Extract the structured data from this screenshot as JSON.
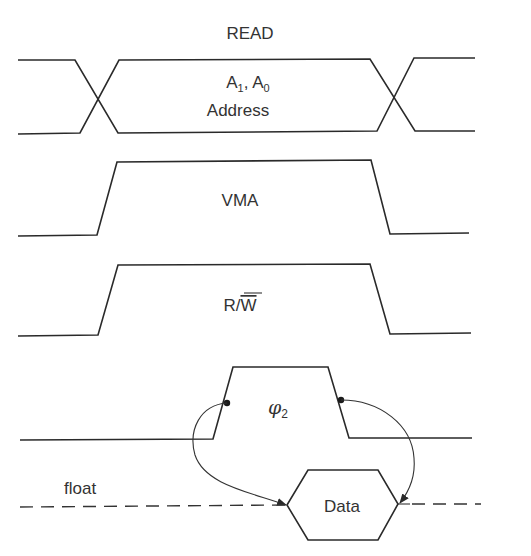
{
  "diagram": {
    "type": "timing-diagram",
    "title": "READ",
    "signals": [
      {
        "id": "address",
        "label_main": "A",
        "label_sub1": "1",
        "label_sep": ", ",
        "label_sub0": "0",
        "label_line2": "Address",
        "shape": "bus"
      },
      {
        "id": "vma",
        "label": "VMA",
        "shape": "pulse-high"
      },
      {
        "id": "rw",
        "label_r": "R/",
        "label_w_overbar": "W",
        "shape": "pulse-high"
      },
      {
        "id": "phi2",
        "label_phi": "φ",
        "label_sub": "2",
        "shape": "clock-pulse"
      },
      {
        "id": "data",
        "label": "Data",
        "float_label": "float",
        "shape": "bus-tristate"
      }
    ],
    "arrows": [
      {
        "from": "phi2-rising-edge",
        "to": "data-valid-start"
      },
      {
        "from": "phi2-falling-edge",
        "to": "data-valid-end"
      }
    ],
    "colors": {
      "line": "#2a2a2a",
      "text": "#333333",
      "background": "#ffffff"
    }
  }
}
